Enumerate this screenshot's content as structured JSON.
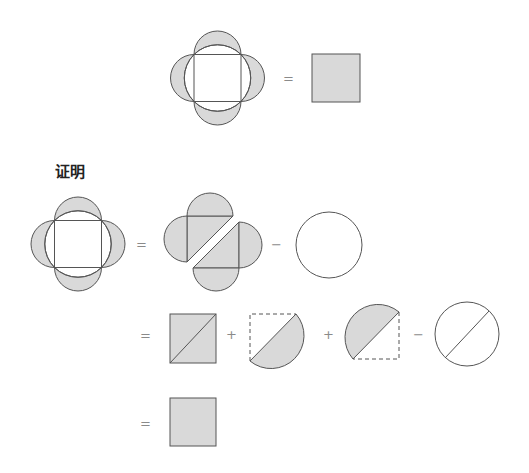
{
  "diagram": {
    "title": "证明",
    "colors": {
      "fill": "#d9d9d9",
      "stroke": "#555555",
      "operator": "#8a8a8a"
    },
    "statement": {
      "lhs": "four-lune figure (square inscribed in circle with semicircles on each side)",
      "operator": "=",
      "rhs": "shaded square"
    },
    "proof_rows": [
      {
        "terms": [
          "four-lune figure",
          "=",
          "two shaded triangle-with-semicircles pairs",
          "−",
          "circle"
        ]
      },
      {
        "terms": [
          "=",
          "shaded square with diagonal",
          "+",
          "half-disc on diagonal (lower-right) in dashed square",
          "+",
          "half-disc on diagonal (upper-left) in dashed square",
          "−",
          "circle with diameter"
        ]
      },
      {
        "terms": [
          "=",
          "shaded square"
        ]
      }
    ],
    "operators": {
      "eq": "=",
      "plus": "+",
      "minus": "−"
    }
  }
}
